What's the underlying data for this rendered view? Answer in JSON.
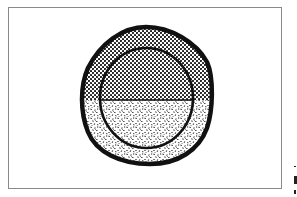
{
  "figure": {
    "type": "cell-diagram",
    "colors": {
      "outline": "#111111",
      "background": "#ffffff",
      "frame": "#8a8a8a"
    },
    "regions": [
      {
        "name": "outer-layer",
        "pattern": "dots-upper / speckle-lower"
      },
      {
        "name": "inner-upper-half",
        "pattern": "dense-dots"
      },
      {
        "name": "inner-lower-half",
        "pattern": "speckle"
      }
    ]
  }
}
